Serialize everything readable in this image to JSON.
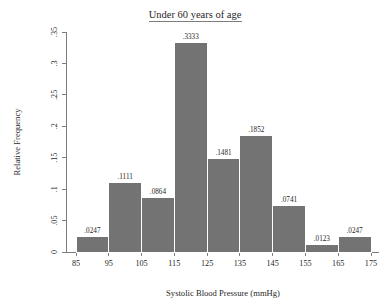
{
  "chart_data": {
    "type": "bar",
    "title": "Under 60 years of age",
    "xlabel": "Systolic Blood Pressure (mmHg)",
    "ylabel": "Relative Frequency",
    "xlim": [
      85,
      175
    ],
    "ylim": [
      0,
      0.35
    ],
    "grid": false,
    "legend": null,
    "bin_width": 10,
    "bin_edges": [
      85,
      95,
      105,
      115,
      125,
      135,
      145,
      155,
      165,
      175
    ],
    "categories": [
      "85-95",
      "95-105",
      "105-115",
      "115-125",
      "125-135",
      "135-145",
      "145-155",
      "155-165",
      "165-175"
    ],
    "values": [
      0.0247,
      0.1111,
      0.0864,
      0.3333,
      0.1481,
      0.1852,
      0.0741,
      0.0123,
      0.0247
    ],
    "data_labels": [
      ".0247",
      ".1111",
      ".0864",
      ".3333",
      ".1481",
      ".1852",
      ".0741",
      ".0123",
      ".0247"
    ],
    "xticks": [
      85,
      95,
      105,
      115,
      125,
      135,
      145,
      155,
      165,
      175
    ],
    "xtick_labels": [
      "85",
      "95",
      "105",
      "115",
      "125",
      "135",
      "145",
      "155",
      "165",
      "175"
    ],
    "yticks": [
      0,
      0.05,
      0.1,
      0.15,
      0.2,
      0.25,
      0.3,
      0.35
    ],
    "ytick_labels": [
      "0",
      ".05",
      ".1",
      ".15",
      ".2",
      ".25",
      ".3",
      ".35"
    ],
    "bar_color": "#737373",
    "bar_edge_color": "#ffffff",
    "axis_color": "#6f6f6f",
    "text_color": "#1f1f1f",
    "background_color": "#ffffff",
    "title_underlined": true
  }
}
